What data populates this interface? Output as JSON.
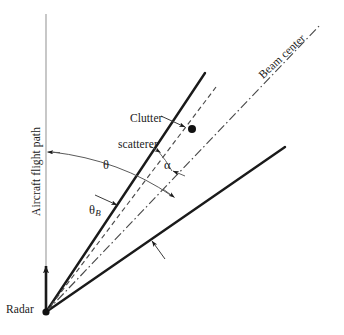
{
  "figure": {
    "domain": "diagram",
    "width": 344,
    "height": 335,
    "background_color": "#ffffff",
    "line_color": "#1a1a1a",
    "axis_color": "#8a8a8a"
  },
  "labels": {
    "radar": "Radar",
    "flight_path": "Aircraft flight path",
    "beam_center": "Beam center",
    "clutter_line1": "Clutter",
    "clutter_line2": "scatterer",
    "theta": "θ",
    "theta_b_symbol": "θ",
    "theta_b_subscript": "B",
    "alpha": "α"
  },
  "geometry": {
    "origin": {
      "x": 46,
      "y": 312,
      "name": "radar-origin"
    },
    "flight_path_line": {
      "x": 46,
      "y_top": 14,
      "y_bottom": 312
    },
    "flight_path_arrow": {
      "x": 46,
      "y_from": 312,
      "y_to": 262
    },
    "beam_edge_upper": {
      "x1": 46,
      "y1": 312,
      "x2": 205,
      "y2": 73
    },
    "beam_edge_lower": {
      "x1": 46,
      "y1": 312,
      "x2": 285,
      "y2": 147
    },
    "scatterer_ray_dashed": {
      "x1": 46,
      "y1": 312,
      "x2": 216,
      "y2": 87
    },
    "beam_center_dashdot": {
      "x1": 46,
      "y1": 312,
      "x2": 321,
      "y2": 24
    },
    "scatterer_dot": {
      "x": 192,
      "y": 129,
      "r": 4
    },
    "theta_arc": {
      "start_x": 46,
      "start_y": 152,
      "end_x": 174,
      "end_y": 196
    },
    "beam_edge_callout": {
      "x1": 165,
      "y1": 259,
      "x2": 151,
      "y2": 240
    }
  },
  "annotations": {
    "theta_description": "Angle between aircraft flight path and clutter scatterer ray",
    "theta_b_description": "Beam edge angle measured from flight path",
    "alpha_description": "Angular offset of clutter scatterer from beam center"
  }
}
